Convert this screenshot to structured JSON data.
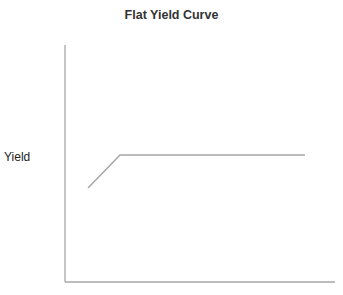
{
  "chart_data": {
    "type": "line",
    "title": "Flat Yield Curve",
    "xlabel": "",
    "ylabel": "Yield",
    "grid": false,
    "legend": null,
    "series": [
      {
        "name": "Yield Curve",
        "color": "#a6a6a6",
        "points_px": [
          [
            88,
            188
          ],
          [
            120,
            155
          ],
          [
            305,
            155
          ]
        ],
        "description": "Short rise at short maturities, then flat for the remaining maturities"
      }
    ],
    "axes": {
      "color": "#a6a6a6",
      "x_axis_px": {
        "x1": 65,
        "x2": 335,
        "y": 282
      },
      "y_axis_px": {
        "x": 65,
        "y1": 45,
        "y2": 282
      }
    }
  }
}
